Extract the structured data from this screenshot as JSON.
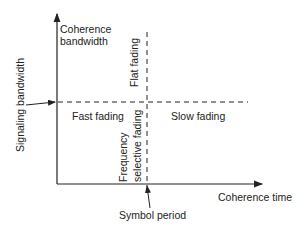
{
  "diagram": {
    "y_axis_label": "Coherence bandwidth",
    "y_axis_label_line1": "Coherence",
    "y_axis_label_line2": "bandwidth",
    "x_axis_label": "Coherence time",
    "signal_label": "Signaling bandwidth",
    "symbol_label": "Symbol period",
    "regions": {
      "flat": "Flat fading",
      "fast": "Fast fading",
      "slow": "Slow fading",
      "freq_line1": "Frequency",
      "freq_line2": "selective fading"
    },
    "colors": {
      "line": "#222222",
      "background": "#ffffff"
    }
  }
}
